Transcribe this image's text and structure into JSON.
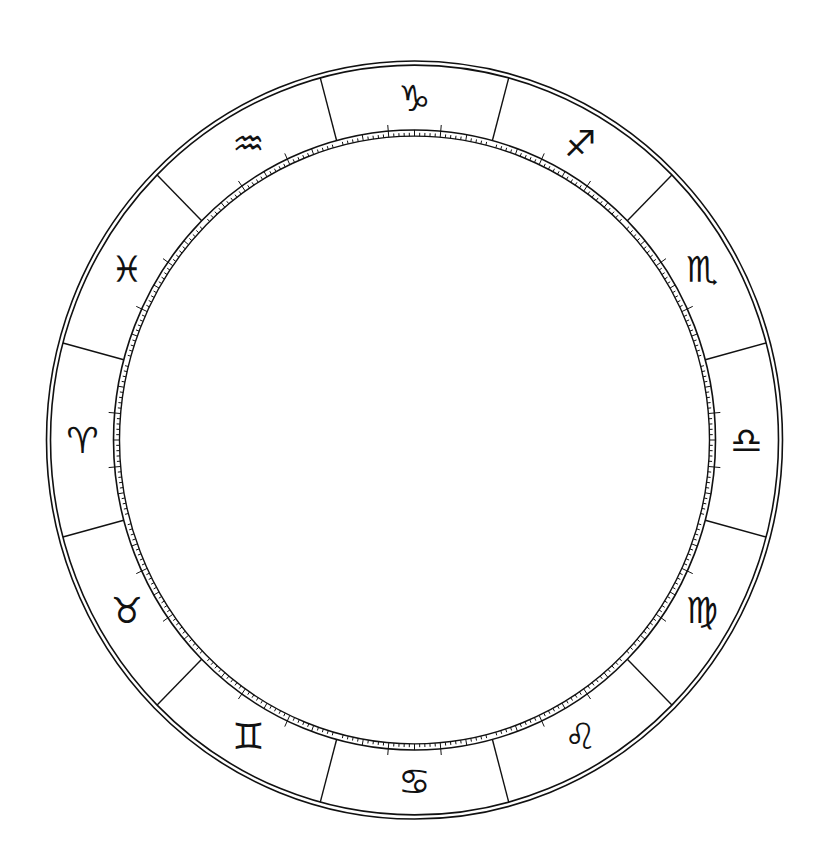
{
  "diagram": {
    "background": "#ffffff",
    "ink_color": "#111111",
    "center": {
      "x": 414.5,
      "y": 440
    },
    "y_scale": 1.03,
    "outer_ring": {
      "r_outer": 368,
      "r_inner": 364
    },
    "degree_band": {
      "r_outer": 301,
      "r_inner": 295,
      "major_tick_len": 6,
      "minor_every_deg": 1,
      "mid_every_deg": 5,
      "long_every_deg": 10
    },
    "sector_degrees": 30,
    "first_boundary_angle_deg": -75,
    "glyph_radius": 332,
    "glyph_size": 36,
    "signs": [
      {
        "name": "Capricorn",
        "glyph": "♑︎",
        "angle_deg": -90
      },
      {
        "name": "Sagittarius",
        "glyph": "♐︎",
        "angle_deg": -60
      },
      {
        "name": "Scorpio",
        "glyph": "♏︎",
        "angle_deg": -30
      },
      {
        "name": "Libra",
        "glyph": "♎︎",
        "angle_deg": 0
      },
      {
        "name": "Virgo",
        "glyph": "♍︎",
        "angle_deg": 30
      },
      {
        "name": "Leo",
        "glyph": "♌︎",
        "angle_deg": 60
      },
      {
        "name": "Cancer",
        "glyph": "♋︎",
        "angle_deg": 90
      },
      {
        "name": "Gemini",
        "glyph": "♊︎",
        "angle_deg": 120
      },
      {
        "name": "Taurus",
        "glyph": "♉︎",
        "angle_deg": 150
      },
      {
        "name": "Aries",
        "glyph": "♈︎",
        "angle_deg": 180
      },
      {
        "name": "Pisces",
        "glyph": "♓︎",
        "angle_deg": 210
      },
      {
        "name": "Aquarius",
        "glyph": "♒︎",
        "angle_deg": 240
      }
    ]
  }
}
